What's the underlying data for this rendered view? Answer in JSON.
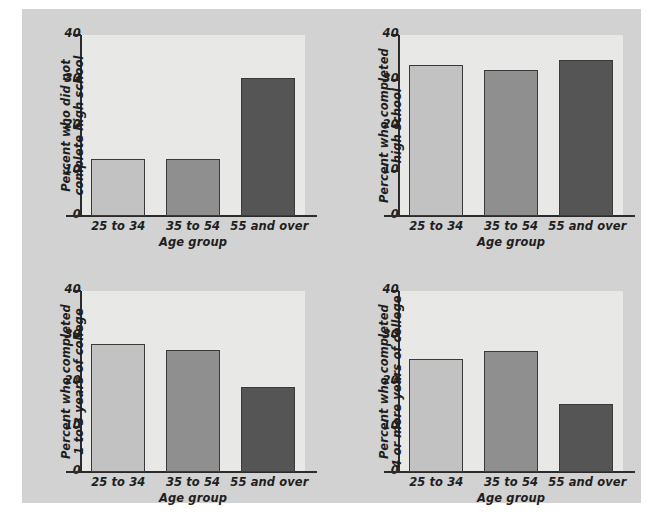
{
  "figure": {
    "background_color": "#d2d2d2",
    "page_color": "#ffffff",
    "plot_area_color": "#e8e8e6",
    "axis_color": "#2b2b2b"
  },
  "series_colors": {
    "25 to 34": "#c2c2c2",
    "35 to 54": "#8f8f8f",
    "55 and over": "#555555"
  },
  "shared": {
    "categories": [
      "25 to 34",
      "35 to 54",
      "55 and over"
    ],
    "xlabel": "Age group",
    "y_ticks": [
      "0",
      "10",
      "20",
      "30",
      "40"
    ],
    "y_tick_values": [
      0,
      10,
      20,
      30,
      40
    ],
    "ylim": [
      0,
      40
    ]
  },
  "chart_data": [
    {
      "id": "top-left",
      "type": "bar",
      "title": "",
      "ylabel": "Percent who did not complete high school",
      "ylabel_lines": [
        "Percent who did not",
        "complete high school"
      ],
      "xlabel": "Age group",
      "categories": [
        "25 to 34",
        "35 to 54",
        "55 and over"
      ],
      "values": [
        12.7,
        12.5,
        30.5
      ],
      "ylim": [
        0,
        40
      ],
      "yticks": [
        0,
        10,
        20,
        30,
        40
      ],
      "grid": false,
      "legend": "none"
    },
    {
      "id": "top-right",
      "type": "bar",
      "title": "",
      "ylabel": "Percent who completed high school",
      "ylabel_lines": [
        "Percent who completed high school"
      ],
      "xlabel": "Age group",
      "categories": [
        "25 to 34",
        "35 to 54",
        "55 and over"
      ],
      "values": [
        33.3,
        32.2,
        34.5
      ],
      "ylim": [
        0,
        40
      ],
      "yticks": [
        0,
        10,
        20,
        30,
        40
      ],
      "grid": false,
      "legend": "none"
    },
    {
      "id": "bottom-left",
      "type": "bar",
      "title": "",
      "ylabel": "Percent who completed 1 to 3 years of college",
      "ylabel_lines": [
        "Percent who completed",
        "1 to 3 years of college"
      ],
      "xlabel": "Age group",
      "categories": [
        "25 to 34",
        "35 to 54",
        "55 and over"
      ],
      "values": [
        28.2,
        27.0,
        18.7
      ],
      "ylim": [
        0,
        40
      ],
      "yticks": [
        0,
        10,
        20,
        30,
        40
      ],
      "grid": false,
      "legend": "none"
    },
    {
      "id": "bottom-right",
      "type": "bar",
      "title": "",
      "ylabel": "Percent who completed 4 or more years of college",
      "ylabel_lines": [
        "Percent who completed",
        "4 or more years of college"
      ],
      "xlabel": "Age group",
      "categories": [
        "25 to 34",
        "35 to 54",
        "55 and over"
      ],
      "values": [
        25.0,
        26.8,
        15.0
      ],
      "ylim": [
        0,
        40
      ],
      "yticks": [
        0,
        10,
        20,
        30,
        40
      ],
      "grid": false,
      "legend": "none"
    }
  ]
}
